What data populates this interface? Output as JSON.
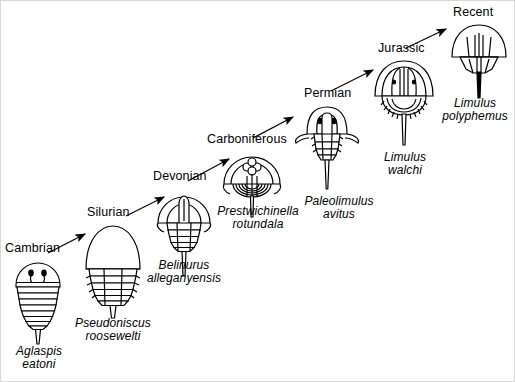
{
  "figure": {
    "line_color": "#000000",
    "background_color": "#ffffff"
  },
  "stages": [
    {
      "period": "Cambrian",
      "genus": "Aglaspis",
      "species": "eatoni",
      "organism": "aglaspis-eatoni-fossil"
    },
    {
      "period": "Silurian",
      "genus": "Pseudoniscus",
      "species": "roosewelti",
      "organism": "pseudoniscus-roosewelti-fossil"
    },
    {
      "period": "Devonian",
      "genus": "Belinurus",
      "species": "alleganyensis",
      "organism": "belinurus-alleganyensis-fossil"
    },
    {
      "period": "Carboniferous",
      "genus": "Prestwichinella",
      "species": "rotundala",
      "organism": "prestwichinella-rotundala-fossil"
    },
    {
      "period": "Permian",
      "genus": "Paleolimulus",
      "species": "avitus",
      "organism": "paleolimulus-avitus-fossil"
    },
    {
      "period": "Jurassic",
      "genus": "Limulus",
      "species": "walchi",
      "organism": "limulus-walchi-fossil"
    },
    {
      "period": "Recent",
      "genus": "Limulus",
      "species": "polyphemus",
      "organism": "limulus-polyphemus-fossil"
    }
  ],
  "arrows": [
    {
      "from": "Cambrian",
      "to": "Silurian"
    },
    {
      "from": "Silurian",
      "to": "Devonian"
    },
    {
      "from": "Devonian",
      "to": "Carboniferous"
    },
    {
      "from": "Carboniferous",
      "to": "Permian"
    },
    {
      "from": "Permian",
      "to": "Jurassic"
    },
    {
      "from": "Jurassic",
      "to": "Recent"
    }
  ]
}
